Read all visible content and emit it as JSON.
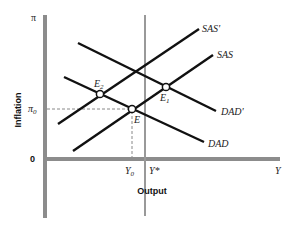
{
  "diagram": {
    "y_axis_label": "Inflation",
    "x_axis_label": "Output",
    "y_axis_top_label": "π",
    "y_axis_pi0_label": "π0",
    "y_axis_pi0_main": "π",
    "y_axis_pi0_sub": "0",
    "origin_label": "0",
    "x_axis_end_label": "Y",
    "y0_main": "Y",
    "y0_sub": "0",
    "ystar_label": "Y*",
    "curves": [
      {
        "id": "sas-prime",
        "label": "SAS'",
        "from": [
          58,
          124
        ],
        "to": [
          199,
          29
        ]
      },
      {
        "id": "sas",
        "label": "SAS",
        "from": [
          73,
          151
        ],
        "to": [
          213,
          55
        ]
      },
      {
        "id": "dad-prime",
        "label": "DAD'",
        "from": [
          78,
          43
        ],
        "to": [
          216,
          111
        ]
      },
      {
        "id": "dad",
        "label": "DAD",
        "from": [
          64,
          77
        ],
        "to": [
          204,
          142
        ]
      }
    ],
    "points": [
      {
        "id": "e",
        "label": "E",
        "x": 132,
        "y": 109
      },
      {
        "id": "e1",
        "label_main": "E",
        "label_sub": "1",
        "x": 166,
        "y": 87
      },
      {
        "id": "e2",
        "label_main": "E",
        "label_sub": "2",
        "x": 100,
        "y": 94
      }
    ],
    "colors": {
      "axis": "#8c8c8c",
      "curve": "#111111",
      "dashed": "#888888",
      "point_fill": "#ffffff"
    }
  }
}
